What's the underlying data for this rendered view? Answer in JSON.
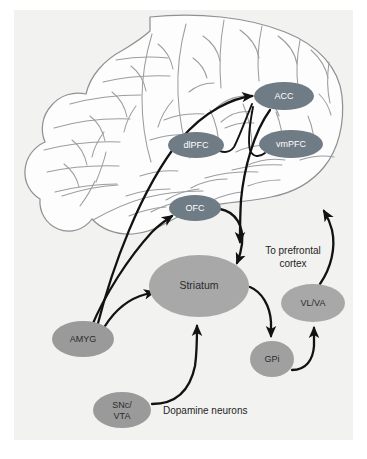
{
  "figure": {
    "background_color": "#f2f2f0",
    "page_color": "#ffffff"
  },
  "brain": {
    "name": "lateral-brain-outline",
    "outline_color": "#8f9294",
    "fill_color": "#fdfdfd"
  },
  "colors": {
    "node_dark": "#6f7b85",
    "node_mid": "#9a9a9a",
    "node_light": "#b0b0b0",
    "arrow": "#121212",
    "text_light": "#ffffff",
    "text_dark": "#2b2b2b"
  },
  "nodes": [
    {
      "id": "acc",
      "label": "ACC",
      "cx": 284,
      "cy": 96,
      "rx": 30,
      "ry": 14,
      "fill": "#6f7b85",
      "text": "light"
    },
    {
      "id": "vmpfc",
      "label": "vmPFC",
      "cx": 291,
      "cy": 144,
      "rx": 32,
      "ry": 14,
      "fill": "#6f7b85",
      "text": "light"
    },
    {
      "id": "dlpfc",
      "label": "dlPFC",
      "cx": 196,
      "cy": 145,
      "rx": 28,
      "ry": 13,
      "fill": "#6f7b85",
      "text": "light"
    },
    {
      "id": "ofc",
      "label": "OFC",
      "cx": 195,
      "cy": 208,
      "rx": 26,
      "ry": 13,
      "fill": "#6f7b85",
      "text": "light"
    },
    {
      "id": "striatum",
      "label": "Striatum",
      "cx": 199,
      "cy": 286,
      "rx": 50,
      "ry": 31,
      "fill": "#a8a8a8",
      "text": "dark"
    },
    {
      "id": "amyg",
      "label": "AMYG",
      "cx": 83,
      "cy": 339,
      "rx": 31,
      "ry": 18,
      "fill": "#9a9a9a",
      "text": "dark"
    },
    {
      "id": "vlva",
      "label": "VL/VA",
      "cx": 313,
      "cy": 303,
      "rx": 32,
      "ry": 19,
      "fill": "#a8a8a8",
      "text": "dark"
    },
    {
      "id": "gpi",
      "label": "GPi",
      "cx": 272,
      "cy": 359,
      "rx": 22,
      "ry": 18,
      "fill": "#a0a0a0",
      "text": "dark"
    }
  ],
  "multiline_nodes": [
    {
      "id": "snc_vta",
      "lines": [
        "SNc/",
        "VTA"
      ],
      "cx": 122,
      "cy": 410,
      "rx": 29,
      "ry": 18,
      "fill": "#9a9a9a",
      "text": "dark"
    }
  ],
  "free_labels": [
    {
      "id": "to-prefrontal-cortex",
      "lines": [
        "To prefrontal",
        "cortex"
      ],
      "x": 293,
      "y": 254,
      "align": "center"
    },
    {
      "id": "dopamine-neurons",
      "lines": [
        "Dopamine neurons"
      ],
      "x": 163,
      "y": 414,
      "align": "left"
    }
  ],
  "connections": [
    {
      "id": "amyg-to-acc",
      "from": "AMYG",
      "to": "ACC",
      "style": "arrow"
    },
    {
      "id": "amyg-to-ofc",
      "from": "AMYG",
      "to": "OFC",
      "style": "arrow"
    },
    {
      "id": "amyg-to-striatum",
      "from": "AMYG",
      "to": "Striatum",
      "style": "arrow"
    },
    {
      "id": "ofc-to-striatum",
      "from": "OFC",
      "to": "Striatum",
      "style": "arrow"
    },
    {
      "id": "acc-to-striatum",
      "from": "ACC",
      "to": "Striatum",
      "style": "arrow"
    },
    {
      "id": "acc-to-dlpfc",
      "from": "ACC",
      "to": "dlPFC",
      "style": "line"
    },
    {
      "id": "acc-to-vmpfc",
      "from": "ACC",
      "to": "vmPFC",
      "style": "line"
    },
    {
      "id": "striatum-to-gpi",
      "from": "Striatum",
      "to": "GPi",
      "style": "arrow"
    },
    {
      "id": "gpi-to-vlva",
      "from": "GPi",
      "to": "VL/VA",
      "style": "arrow"
    },
    {
      "id": "vlva-to-prefrontal",
      "from": "VL/VA",
      "to": "prefrontal cortex",
      "style": "arrow"
    },
    {
      "id": "sncvta-to-striatum",
      "from": "SNc/VTA",
      "to": "Striatum",
      "style": "arrow"
    }
  ]
}
